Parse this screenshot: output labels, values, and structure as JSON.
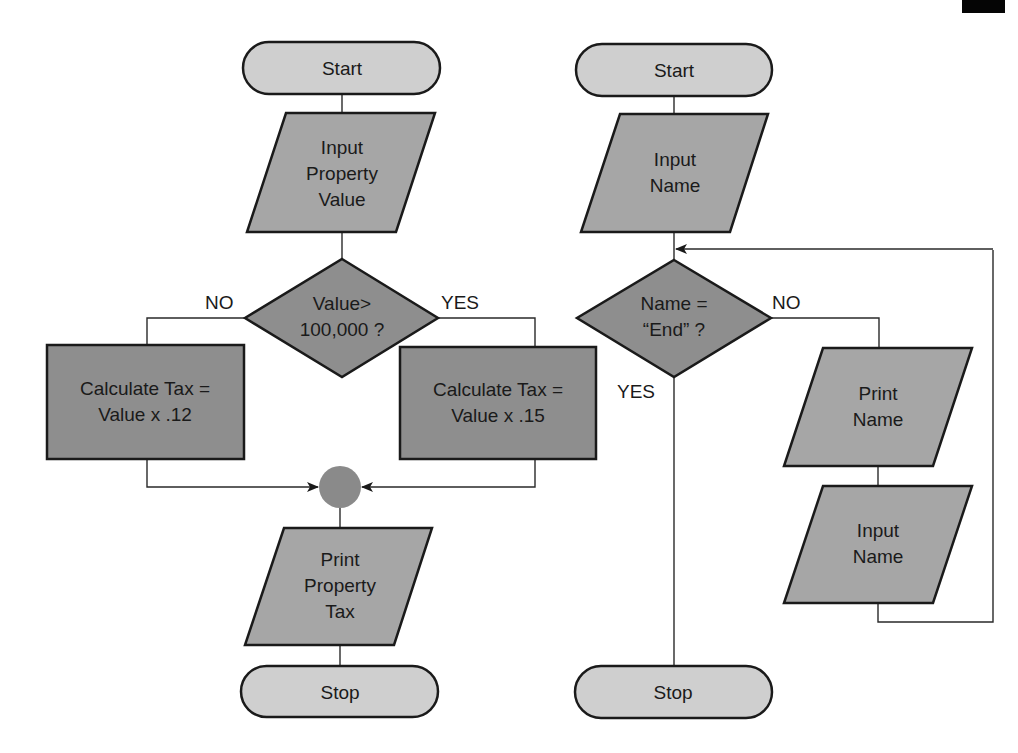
{
  "diagram": {
    "left_flowchart": {
      "start": "Start",
      "input": [
        "Input",
        "Property",
        "Value"
      ],
      "decision": [
        "Value>",
        "100,000 ?"
      ],
      "no_label": "NO",
      "yes_label": "YES",
      "process_no": [
        "Calculate Tax =",
        "Value x .12"
      ],
      "process_yes": [
        "Calculate Tax =",
        "Value x .15"
      ],
      "output": [
        "Print",
        "Property",
        "Tax"
      ],
      "stop": "Stop"
    },
    "right_flowchart": {
      "start": "Start",
      "input": [
        "Input",
        "Name"
      ],
      "decision": [
        "Name =",
        "“End” ?"
      ],
      "no_label": "NO",
      "yes_label": "YES",
      "output": [
        "Print",
        "Name"
      ],
      "input_loop": [
        "Input",
        "Name"
      ],
      "stop": "Stop"
    },
    "colors": {
      "terminal_fill": "#cfcfcf",
      "io_fill": "#a6a6a6",
      "process_fill": "#8e8e8e",
      "connector_fill": "#8a8a8a",
      "stroke": "#1a1a1a"
    }
  }
}
